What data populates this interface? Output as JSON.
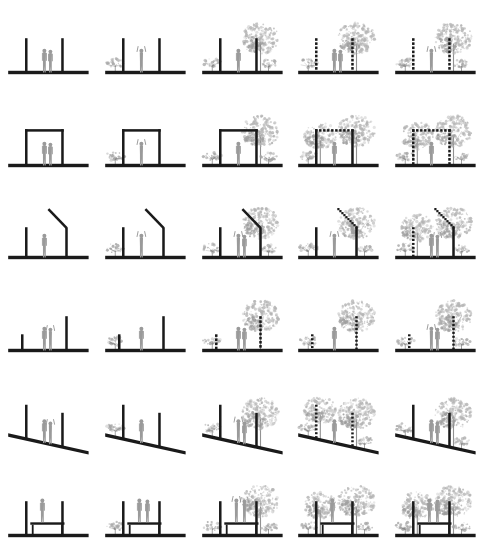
{
  "figure": {
    "type": "architectural-section-grid",
    "rows": 6,
    "columns": 5,
    "background_color": "#ffffff",
    "colors": {
      "structure": "#1a1a1a",
      "ground": "#1a1a1a",
      "figure": "#9a9a9a",
      "tree": "#b4b4b4",
      "tree_dark": "#9c9c9c",
      "shrub": "#a8a8a8",
      "trunk": "#6e6e6e"
    },
    "column_legend": [
      "bare structure, no planting",
      "structure with single shrub",
      "structure with tree and shrubs",
      "dashed structure with tree and shrubs",
      "dissolving structure with dense planting"
    ],
    "row_legend": [
      "paired vertical posts",
      "portal frame with beam",
      "vertical post with angled mast",
      "offset short and tall posts",
      "paired posts on sloped ground",
      "paired posts with raised platform"
    ],
    "cells": [
      {
        "row": 1,
        "col": 1,
        "structure": "posts",
        "posts": "solid",
        "figures": 2,
        "trees": 0,
        "shrubs": 0,
        "slope": false,
        "platform": false
      },
      {
        "row": 1,
        "col": 2,
        "structure": "posts",
        "posts": "solid",
        "figures": 1,
        "trees": 0,
        "shrubs": 1,
        "slope": false,
        "platform": false
      },
      {
        "row": 1,
        "col": 3,
        "structure": "posts",
        "posts": "solid",
        "figures": 1,
        "trees": 1,
        "shrubs": 2,
        "slope": false,
        "platform": false
      },
      {
        "row": 1,
        "col": 4,
        "structure": "posts",
        "posts": "dashed",
        "figures": 2,
        "trees": 1,
        "shrubs": 1,
        "slope": false,
        "platform": false
      },
      {
        "row": 1,
        "col": 5,
        "structure": "posts",
        "posts": "dashed",
        "figures": 1,
        "trees": 1,
        "shrubs": 2,
        "slope": false,
        "platform": false
      },
      {
        "row": 2,
        "col": 1,
        "structure": "portal",
        "posts": "solid",
        "figures": 2,
        "trees": 0,
        "shrubs": 0,
        "slope": false,
        "platform": false
      },
      {
        "row": 2,
        "col": 2,
        "structure": "portal",
        "posts": "solid",
        "figures": 1,
        "trees": 0,
        "shrubs": 1,
        "slope": false,
        "platform": false
      },
      {
        "row": 2,
        "col": 3,
        "structure": "portal",
        "posts": "solid",
        "figures": 1,
        "trees": 1,
        "shrubs": 2,
        "slope": false,
        "platform": false
      },
      {
        "row": 2,
        "col": 4,
        "structure": "portal",
        "posts": "dashed-beam",
        "figures": 1,
        "trees": 2,
        "shrubs": 1,
        "slope": false,
        "platform": false
      },
      {
        "row": 2,
        "col": 5,
        "structure": "portal",
        "posts": "dashed",
        "figures": 1,
        "trees": 2,
        "shrubs": 2,
        "slope": false,
        "platform": false
      },
      {
        "row": 3,
        "col": 1,
        "structure": "mast",
        "posts": "solid",
        "figures": 1,
        "trees": 0,
        "shrubs": 0,
        "slope": false,
        "platform": false
      },
      {
        "row": 3,
        "col": 2,
        "structure": "mast",
        "posts": "solid",
        "figures": 1,
        "trees": 0,
        "shrubs": 1,
        "slope": false,
        "platform": false
      },
      {
        "row": 3,
        "col": 3,
        "structure": "mast",
        "posts": "solid",
        "figures": 2,
        "trees": 1,
        "shrubs": 2,
        "slope": false,
        "platform": false
      },
      {
        "row": 3,
        "col": 4,
        "structure": "mast",
        "posts": "dotted-arm",
        "figures": 1,
        "trees": 1,
        "shrubs": 2,
        "slope": false,
        "platform": false
      },
      {
        "row": 3,
        "col": 5,
        "structure": "mast",
        "posts": "dotted",
        "figures": 2,
        "trees": 2,
        "shrubs": 2,
        "slope": false,
        "platform": false
      },
      {
        "row": 4,
        "col": 1,
        "structure": "offset",
        "posts": "solid",
        "figures": 2,
        "trees": 0,
        "shrubs": 0,
        "slope": false,
        "platform": false
      },
      {
        "row": 4,
        "col": 2,
        "structure": "offset",
        "posts": "solid",
        "figures": 1,
        "trees": 0,
        "shrubs": 1,
        "slope": false,
        "platform": false
      },
      {
        "row": 4,
        "col": 3,
        "structure": "offset",
        "posts": "dashed",
        "figures": 2,
        "trees": 1,
        "shrubs": 1,
        "slope": false,
        "platform": false
      },
      {
        "row": 4,
        "col": 4,
        "structure": "offset",
        "posts": "dotted",
        "figures": 1,
        "trees": 1,
        "shrubs": 1,
        "slope": false,
        "platform": false
      },
      {
        "row": 4,
        "col": 5,
        "structure": "offset",
        "posts": "dotted",
        "figures": 2,
        "trees": 1,
        "shrubs": 2,
        "slope": false,
        "platform": false
      },
      {
        "row": 5,
        "col": 1,
        "structure": "posts",
        "posts": "solid",
        "figures": 2,
        "trees": 0,
        "shrubs": 0,
        "slope": true,
        "platform": false
      },
      {
        "row": 5,
        "col": 2,
        "structure": "posts",
        "posts": "solid",
        "figures": 1,
        "trees": 0,
        "shrubs": 1,
        "slope": true,
        "platform": false
      },
      {
        "row": 5,
        "col": 3,
        "structure": "posts",
        "posts": "solid",
        "figures": 2,
        "trees": 1,
        "shrubs": 1,
        "slope": true,
        "platform": false
      },
      {
        "row": 5,
        "col": 4,
        "structure": "posts",
        "posts": "dotted",
        "figures": 1,
        "trees": 2,
        "shrubs": 2,
        "slope": true,
        "platform": false
      },
      {
        "row": 5,
        "col": 5,
        "structure": "posts",
        "posts": "solid",
        "figures": 2,
        "trees": 1,
        "shrubs": 2,
        "slope": true,
        "platform": false
      },
      {
        "row": 6,
        "col": 1,
        "structure": "posts",
        "posts": "solid",
        "figures": 1,
        "trees": 0,
        "shrubs": 0,
        "slope": false,
        "platform": true
      },
      {
        "row": 6,
        "col": 2,
        "structure": "posts",
        "posts": "solid",
        "figures": 2,
        "trees": 0,
        "shrubs": 1,
        "slope": false,
        "platform": true
      },
      {
        "row": 6,
        "col": 3,
        "structure": "posts",
        "posts": "solid",
        "figures": 2,
        "trees": 1,
        "shrubs": 2,
        "slope": false,
        "platform": true
      },
      {
        "row": 6,
        "col": 4,
        "structure": "posts",
        "posts": "solid",
        "figures": 1,
        "trees": 2,
        "shrubs": 2,
        "slope": false,
        "platform": true
      },
      {
        "row": 6,
        "col": 5,
        "structure": "posts",
        "posts": "solid",
        "figures": 2,
        "trees": 2,
        "shrubs": 2,
        "slope": false,
        "platform": true
      }
    ]
  }
}
